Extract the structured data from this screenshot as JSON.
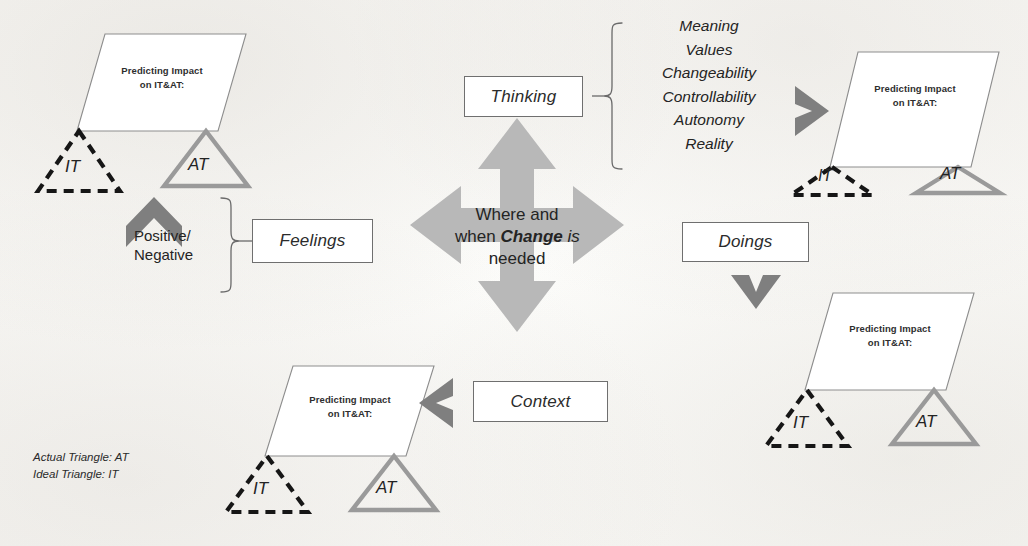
{
  "diagram": {
    "center": {
      "line1": "Where and",
      "line2_pre": "when ",
      "line2_bold": "Change",
      "line2_post": " is",
      "line3": "needed",
      "color": "#b8b8b8"
    },
    "branches": [
      {
        "id": "thinking",
        "label": "Thinking"
      },
      {
        "id": "feelings",
        "label": "Feelings"
      },
      {
        "id": "doings",
        "label": "Doings"
      },
      {
        "id": "context",
        "label": "Context"
      }
    ],
    "thinking_attributes": [
      "Meaning",
      "Values",
      "Changeability",
      "Controllability",
      "Autonomy",
      "Reality"
    ],
    "feelings_attributes": {
      "line1": "Positive/",
      "line2": "Negative"
    },
    "prediction_groups": [
      {
        "id": "top-left",
        "caption_line1": "Predicting Impact",
        "caption_line2": "on IT&AT:",
        "ideal_label": "IT",
        "actual_label": "AT"
      },
      {
        "id": "top-right",
        "caption_line1": "Predicting Impact",
        "caption_line2": "on IT&AT:",
        "ideal_label": "IT",
        "actual_label": "AT"
      },
      {
        "id": "bottom-right",
        "caption_line1": "Predicting Impact",
        "caption_line2": "on IT&AT:",
        "ideal_label": "IT",
        "actual_label": "AT"
      },
      {
        "id": "bottom-center",
        "caption_line1": "Predicting Impact",
        "caption_line2": "on IT&AT:",
        "ideal_label": "IT",
        "actual_label": "AT"
      }
    ],
    "legend": {
      "line1": "Actual Triangle: AT",
      "line2": "Ideal Triangle: IT"
    },
    "colors": {
      "cross_arrow": "#b8b8b8",
      "chevron": "#7f7f7f",
      "actual_triangle_stroke": "#9a9a9a",
      "ideal_triangle_stroke": "#161616",
      "box_border": "#6f6f6f",
      "parallelogram_stroke": "#8d8d8d",
      "text": "#242424"
    }
  }
}
